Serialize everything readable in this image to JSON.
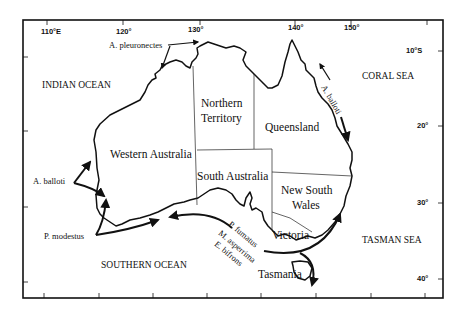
{
  "map": {
    "region": "Australia",
    "longitude_labels": [
      {
        "label": "110°E",
        "x": 30
      },
      {
        "label": "120°",
        "x": 117
      },
      {
        "label": "130°",
        "x": 190
      },
      {
        "label": "140°",
        "x": 294
      },
      {
        "label": "150°",
        "x": 349
      }
    ],
    "latitude_labels": [
      {
        "label": "10°S",
        "y": 50
      },
      {
        "label": "20°",
        "y": 126
      },
      {
        "label": "30°",
        "y": 203
      },
      {
        "label": "40°",
        "y": 279
      }
    ],
    "oceans": [
      {
        "id": "indian",
        "label": "INDIAN OCEAN"
      },
      {
        "id": "coral",
        "label": "CORAL SEA"
      },
      {
        "id": "southern",
        "label": "SOUTHERN OCEAN"
      },
      {
        "id": "tasman",
        "label": "TASMAN SEA"
      }
    ],
    "states": {
      "western_australia": "Western Australia",
      "northern_territory_1": "Northern",
      "northern_territory_2": "Territory",
      "queensland": "Queensland",
      "south_australia": "South Australia",
      "nsw_1": "New South",
      "nsw_2": "Wales",
      "victoria": "Victoria",
      "tasmania": "Tasmania"
    },
    "species": {
      "a_pleuronectes": "A. pleuronectes",
      "a_balloti_west": "A. balloti",
      "a_balloti_east": "A. balloti",
      "p_modestus": "P. modestus",
      "p_fumatus": "P. fumatus",
      "m_asperrima": "M. asperrima",
      "e_bifrons": "E. bifrons"
    }
  },
  "colors": {
    "ink": "#111111",
    "background": "#ffffff"
  }
}
